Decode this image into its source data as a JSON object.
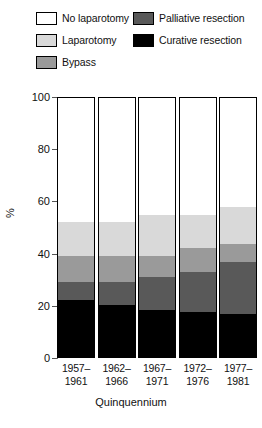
{
  "legend": {
    "items": [
      {
        "label": "No laparotomy",
        "key": "no_laparotomy",
        "color": "#ffffff"
      },
      {
        "label": "Laparotomy",
        "key": "laparotomy",
        "color": "#d9d9d9"
      },
      {
        "label": "Bypass",
        "key": "bypass",
        "color": "#9a9a9a"
      },
      {
        "label": "Palliative resection",
        "key": "palliative_resection",
        "color": "#595959"
      },
      {
        "label": "Curative resection",
        "key": "curative_resection",
        "color": "#000000"
      }
    ]
  },
  "axes": {
    "ylabel": "%",
    "xlabel": "Quinquennium",
    "yticks": [
      "0",
      "20",
      "40",
      "60",
      "80",
      "100"
    ],
    "ylim": [
      0,
      100
    ]
  },
  "chart_data": {
    "type": "bar",
    "title": "",
    "subtitle": "",
    "stacked": true,
    "xlabel": "Quinquennium",
    "ylabel": "%",
    "ylim": [
      0,
      100
    ],
    "yticks": [
      0,
      20,
      40,
      60,
      80,
      100
    ],
    "grid": false,
    "legend_position": "top",
    "categories": [
      "1957–\n1961",
      "1962–\n1966",
      "1967–\n1971",
      "1972–\n1976",
      "1977–\n1981"
    ],
    "category_lines": [
      [
        "1957–",
        "1961"
      ],
      [
        "1962–",
        "1966"
      ],
      [
        "1967–",
        "1971"
      ],
      [
        "1972–",
        "1976"
      ],
      [
        "1977–",
        "1981"
      ]
    ],
    "series": [
      {
        "name": "No laparotomy",
        "color": "#ffffff",
        "values": [
          48,
          48,
          45,
          45,
          42
        ]
      },
      {
        "name": "Laparotomy",
        "color": "#d9d9d9",
        "values": [
          13,
          13,
          16,
          13,
          14.5
        ]
      },
      {
        "name": "Bypass",
        "color": "#9a9a9a",
        "values": [
          10,
          10,
          8,
          9,
          7
        ]
      },
      {
        "name": "Palliative resection",
        "color": "#595959",
        "values": [
          7,
          9,
          13,
          15.5,
          20
        ]
      },
      {
        "name": "Curative resection",
        "color": "#000000",
        "values": [
          22,
          20,
          18,
          17.5,
          16.5
        ]
      }
    ],
    "stack_order_top_to_bottom": [
      "No laparotomy",
      "Laparotomy",
      "Bypass",
      "Palliative resection",
      "Curative resection"
    ]
  }
}
